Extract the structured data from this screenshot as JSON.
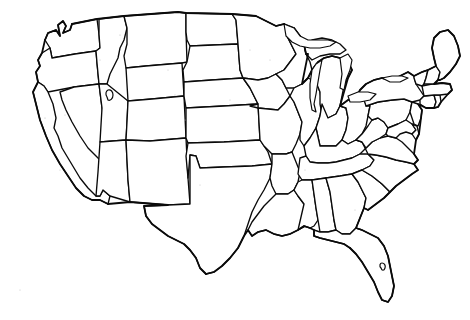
{
  "figure": {
    "kind": "map",
    "projection_look": "conic",
    "label_text": "",
    "has_labels": false,
    "has_legend": false,
    "has_scale_bar": false,
    "has_compass": false,
    "background_color": "#ffffff",
    "line_color": "#0a0a0a",
    "fill_color": "#ffffff",
    "line_style": "solid",
    "rendering": "scanned line art, black ink on white paper",
    "width_px": 470,
    "height_px": 320
  },
  "map": {
    "region_name": "Contiguous United States",
    "feature_type": "administrative boundaries",
    "boundary_level": "state",
    "includes_alaska": false,
    "includes_hawaii": false,
    "water_features": [
      "Great Lakes",
      "Great Salt Lake"
    ],
    "coastlines": [
      "Pacific",
      "Atlantic",
      "Gulf of Mexico"
    ],
    "state_count": 48,
    "states": [
      {
        "code": "WA",
        "name": "Washington"
      },
      {
        "code": "OR",
        "name": "Oregon"
      },
      {
        "code": "CA",
        "name": "California"
      },
      {
        "code": "NV",
        "name": "Nevada"
      },
      {
        "code": "ID",
        "name": "Idaho"
      },
      {
        "code": "MT",
        "name": "Montana"
      },
      {
        "code": "WY",
        "name": "Wyoming"
      },
      {
        "code": "UT",
        "name": "Utah"
      },
      {
        "code": "AZ",
        "name": "Arizona"
      },
      {
        "code": "CO",
        "name": "Colorado"
      },
      {
        "code": "NM",
        "name": "New Mexico"
      },
      {
        "code": "ND",
        "name": "North Dakota"
      },
      {
        "code": "SD",
        "name": "South Dakota"
      },
      {
        "code": "NE",
        "name": "Nebraska"
      },
      {
        "code": "KS",
        "name": "Kansas"
      },
      {
        "code": "OK",
        "name": "Oklahoma"
      },
      {
        "code": "TX",
        "name": "Texas"
      },
      {
        "code": "MN",
        "name": "Minnesota"
      },
      {
        "code": "IA",
        "name": "Iowa"
      },
      {
        "code": "MO",
        "name": "Missouri"
      },
      {
        "code": "AR",
        "name": "Arkansas"
      },
      {
        "code": "LA",
        "name": "Louisiana"
      },
      {
        "code": "WI",
        "name": "Wisconsin"
      },
      {
        "code": "IL",
        "name": "Illinois"
      },
      {
        "code": "MI",
        "name": "Michigan"
      },
      {
        "code": "IN",
        "name": "Indiana"
      },
      {
        "code": "OH",
        "name": "Ohio"
      },
      {
        "code": "KY",
        "name": "Kentucky"
      },
      {
        "code": "TN",
        "name": "Tennessee"
      },
      {
        "code": "MS",
        "name": "Mississippi"
      },
      {
        "code": "AL",
        "name": "Alabama"
      },
      {
        "code": "GA",
        "name": "Georgia"
      },
      {
        "code": "FL",
        "name": "Florida"
      },
      {
        "code": "SC",
        "name": "South Carolina"
      },
      {
        "code": "NC",
        "name": "North Carolina"
      },
      {
        "code": "VA",
        "name": "Virginia"
      },
      {
        "code": "WV",
        "name": "West Virginia"
      },
      {
        "code": "MD",
        "name": "Maryland"
      },
      {
        "code": "DE",
        "name": "Delaware"
      },
      {
        "code": "PA",
        "name": "Pennsylvania"
      },
      {
        "code": "NJ",
        "name": "New Jersey"
      },
      {
        "code": "NY",
        "name": "New York"
      },
      {
        "code": "CT",
        "name": "Connecticut"
      },
      {
        "code": "RI",
        "name": "Rhode Island"
      },
      {
        "code": "MA",
        "name": "Massachusetts"
      },
      {
        "code": "VT",
        "name": "Vermont"
      },
      {
        "code": "NH",
        "name": "New Hampshire"
      },
      {
        "code": "ME",
        "name": "Maine"
      }
    ]
  }
}
